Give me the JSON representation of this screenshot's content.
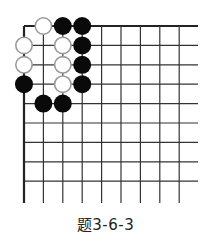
{
  "diagram": {
    "type": "go-problem",
    "caption": "题3-6-3",
    "board": {
      "visible_columns": 9,
      "visible_rows": 9,
      "corner": "top-left",
      "origin_px": [
        24,
        26
      ],
      "spacing_px": 19.4,
      "line_right_end_px": 198,
      "line_bottom_end_px": 203,
      "line_color": "#333333",
      "edge_line_color": "#222222"
    },
    "stones": [
      {
        "color": "white",
        "col": 1,
        "row": 0
      },
      {
        "color": "black",
        "col": 2,
        "row": 0
      },
      {
        "color": "black",
        "col": 3,
        "row": 0
      },
      {
        "color": "white",
        "col": 0,
        "row": 1
      },
      {
        "color": "white",
        "col": 2,
        "row": 1
      },
      {
        "color": "black",
        "col": 3,
        "row": 1
      },
      {
        "color": "white",
        "col": 0,
        "row": 2
      },
      {
        "color": "white",
        "col": 2,
        "row": 2
      },
      {
        "color": "black",
        "col": 3,
        "row": 2
      },
      {
        "color": "black",
        "col": 0,
        "row": 3
      },
      {
        "color": "white",
        "col": 2,
        "row": 3
      },
      {
        "color": "black",
        "col": 3,
        "row": 3
      },
      {
        "color": "black",
        "col": 1,
        "row": 4
      },
      {
        "color": "black",
        "col": 2,
        "row": 4
      }
    ],
    "stone_style": {
      "black_fill": "#0a0a0a",
      "white_fill": "#ffffff",
      "white_stroke": "#9a9a9a",
      "diameter_px": 18
    }
  }
}
